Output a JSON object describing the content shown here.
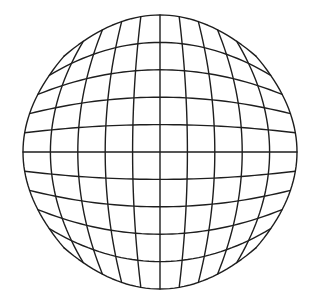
{
  "figure": {
    "line_color": "#1e1e1e",
    "background": "#ffffff",
    "center": [
      160,
      152
    ],
    "scale": 137,
    "distortion_coefficient": 0.3,
    "grid_divisions": 10,
    "vertical_line_crossings_at_center_row_px": [
      21,
      42,
      76,
      106,
      133,
      160,
      187,
      214,
      244,
      278,
      299
    ],
    "horizontal_line_crossings_at_center_column_px": [
      17,
      38,
      70,
      98,
      125,
      152,
      178,
      204,
      232,
      265,
      286
    ]
  }
}
